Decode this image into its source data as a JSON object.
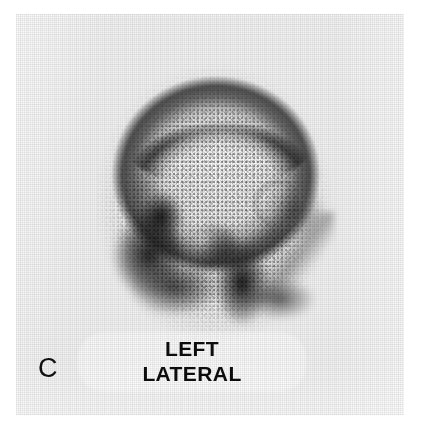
{
  "figure": {
    "panel_label": "C",
    "modality": "bone-scintigraphy",
    "annotation": {
      "line1": "LEFT",
      "line2": "LATERAL"
    },
    "colors": {
      "film_background": "#f2f2f2",
      "page_background": "#ffffff",
      "text": "#0d0d0d",
      "panel_letter": "#111111",
      "uptake_dark": "#141414",
      "photopenic_light": "#ffffff"
    }
  },
  "chart_data": {
    "type": "heatmap",
    "title": "LEFT LATERAL",
    "subtitle": "C",
    "xlabel": "",
    "ylabel": "",
    "grid": false,
    "legend_position": "none",
    "colormap": "grayscale-inverted",
    "value_meaning": "radiotracer uptake (darker = higher counts)",
    "regions": [
      {
        "name": "calvarium-superior-rim",
        "x": 0.5,
        "y": 0.18,
        "intensity": 0.8
      },
      {
        "name": "calvarium-posterior-rim",
        "x": 0.82,
        "y": 0.4,
        "intensity": 0.72
      },
      {
        "name": "calvarium-anterior-rim",
        "x": 0.16,
        "y": 0.38,
        "intensity": 0.7
      },
      {
        "name": "vault-interior-photopenic",
        "x": 0.5,
        "y": 0.4,
        "intensity": 0.08
      },
      {
        "name": "skull-base-anterior",
        "x": 0.22,
        "y": 0.68,
        "intensity": 0.95
      },
      {
        "name": "facial-bones",
        "x": 0.42,
        "y": 0.66,
        "intensity": 0.97
      },
      {
        "name": "mandible-ramus",
        "x": 0.6,
        "y": 0.78,
        "intensity": 0.94
      },
      {
        "name": "skull-base-posterior",
        "x": 0.76,
        "y": 0.8,
        "intensity": 0.68
      },
      {
        "name": "orbit-ring",
        "x": 0.74,
        "y": 0.52,
        "intensity": 0.38
      }
    ]
  }
}
